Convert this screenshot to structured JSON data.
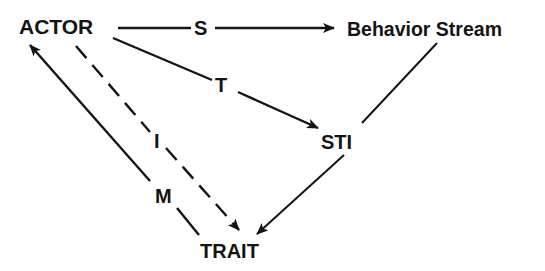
{
  "nodes": {
    "actor": {
      "label": "ACTOR"
    },
    "behavior_stream": {
      "label": "Behavior Stream"
    },
    "sti": {
      "label": "STI"
    },
    "trait": {
      "label": "TRAIT"
    }
  },
  "edges": {
    "s": {
      "label": "S",
      "from": "ACTOR",
      "to": "Behavior Stream",
      "style": "solid"
    },
    "t": {
      "label": "T",
      "from": "ACTOR",
      "to": "STI",
      "style": "solid"
    },
    "i": {
      "label": "I",
      "from": "ACTOR",
      "to": "TRAIT",
      "style": "dashed"
    },
    "m": {
      "label": "M",
      "from": "TRAIT",
      "to": "ACTOR",
      "style": "solid"
    },
    "bs_sti": {
      "label": "",
      "from": "Behavior Stream",
      "to": "STI",
      "style": "solid"
    },
    "sti_trait": {
      "label": "",
      "from": "STI",
      "to": "TRAIT",
      "style": "solid"
    }
  },
  "colors": {
    "ink": "#141414",
    "background": "#ffffff"
  }
}
